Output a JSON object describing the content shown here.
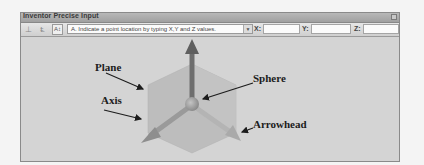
{
  "window": {
    "title": "Inventor Precise Input"
  },
  "toolbar": {
    "icons": [
      {
        "name": "delta-mode-icon",
        "glyph": "⊥"
      },
      {
        "name": "origin-mode-icon",
        "glyph": "Ⱡ"
      },
      {
        "name": "precise-input-icon",
        "glyph": "A↕"
      }
    ],
    "mode_dropdown": {
      "selected": "A. Indicate a point location by typing X,Y and Z values."
    },
    "x_label": "X:",
    "y_label": "Y:",
    "z_label": "Z:",
    "x_value": "",
    "y_value": "",
    "z_value": ""
  },
  "illustration": {
    "labels": {
      "plane": "Plane",
      "axis": "Axis",
      "sphere": "Sphere",
      "arrowhead": "Arrowhead"
    },
    "colors": {
      "background": "#d4d4d4",
      "plane": "#bdbdbd",
      "axis_vertical": "#6e6e6e",
      "axis_diagonal": "#9a9a9a",
      "sphere": "#a8a8a8",
      "leader": "#1c1c1c"
    }
  }
}
